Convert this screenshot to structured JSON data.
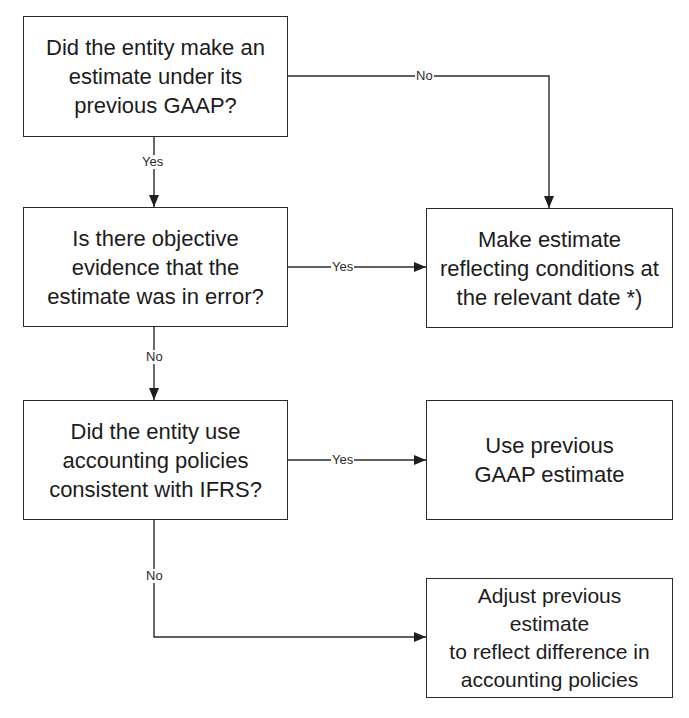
{
  "diagram": {
    "type": "flowchart",
    "nodes": {
      "q1": {
        "kind": "decision",
        "text": "Did the entity make an\nestimate under its\nprevious GAAP?"
      },
      "q2": {
        "kind": "decision",
        "text": "Is there objective\nevidence that the\nestimate was in error?"
      },
      "q3": {
        "kind": "decision",
        "text": "Did the entity use\naccounting policies\nconsistent with IFRS?"
      },
      "r1": {
        "kind": "outcome",
        "text": "Make estimate\nreflecting conditions at\nthe relevant date *)"
      },
      "r2": {
        "kind": "outcome",
        "text": "Use previous\nGAAP estimate"
      },
      "r3": {
        "kind": "outcome",
        "text": "Adjust  previous estimate\nto reflect difference in\naccounting policies"
      }
    },
    "edges": [
      {
        "from": "q1",
        "to": "q2",
        "label": "Yes"
      },
      {
        "from": "q1",
        "to": "r1",
        "label": "No"
      },
      {
        "from": "q2",
        "to": "r1",
        "label": "Yes"
      },
      {
        "from": "q2",
        "to": "q3",
        "label": "No"
      },
      {
        "from": "q3",
        "to": "r2",
        "label": "Yes"
      },
      {
        "from": "q3",
        "to": "r3",
        "label": "No"
      }
    ],
    "colors": {
      "line": "#2b2b2b",
      "text": "#1c1c1c",
      "background": "#ffffff"
    }
  }
}
